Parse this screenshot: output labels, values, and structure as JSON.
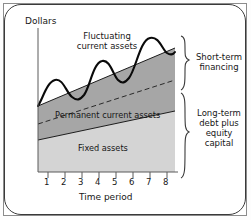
{
  "chart_data": {
    "type": "area",
    "title": "",
    "xlabel": "Time period",
    "ylabel": "Dollars",
    "xlim": [
      0,
      9
    ],
    "ylim": [
      0,
      100
    ],
    "grid": false,
    "legend_position": "inline-annotations",
    "xticks": [
      "1",
      "2",
      "3",
      "4",
      "5",
      "6",
      "7",
      "8"
    ],
    "yticks": [],
    "series": [
      {
        "name": "Fixed assets",
        "kind": "area",
        "color": "#d4d4d4",
        "x": [
          0,
          9
        ],
        "values": [
          18,
          40
        ],
        "note": "lower light-gray band, rises linearly left to right"
      },
      {
        "name": "Permanent current assets",
        "kind": "area",
        "color": "#a6a6a6",
        "x": [
          0,
          9
        ],
        "values": [
          30,
          62
        ],
        "note": "medium-gray band stacked above fixed assets, dashed midline inside"
      },
      {
        "name": "Fluctuating current assets",
        "kind": "line",
        "color": "#000000",
        "x": [
          0,
          0.6,
          1.3,
          2.0,
          2.7,
          3.3,
          4.0,
          4.7,
          5.3,
          6.0,
          6.7,
          7.4,
          8.1,
          8.7
        ],
        "values": [
          30,
          36,
          43,
          39,
          37,
          46,
          55,
          50,
          49,
          58,
          68,
          74,
          76,
          73
        ],
        "note": "wavy oscillating curve above the bands, four rising humps"
      }
    ],
    "annotations": [
      {
        "text": "Fluctuating current assets",
        "position": "upper-middle"
      },
      {
        "text": "Permanent current assets",
        "position": "inside-medium-gray-band"
      },
      {
        "text": "Fixed assets",
        "position": "inside-light-gray-band"
      },
      {
        "text": "Short-term financing",
        "position": "right-brace-upper"
      },
      {
        "text": "Long-term debt plus equity capital",
        "position": "right-brace-lower"
      }
    ]
  },
  "axes": {
    "y_label": "Dollars",
    "x_label": "Time period",
    "x_ticks": [
      "1",
      "2",
      "3",
      "4",
      "5",
      "6",
      "7",
      "8"
    ]
  },
  "annotations": {
    "fluctuating_line1": "Fluctuating",
    "fluctuating_line2": "current assets",
    "permanent": "Permanent current assets",
    "fixed": "Fixed assets"
  },
  "braces": {
    "short_term_line1": "Short-term",
    "short_term_line2": "financing",
    "long_term_line1": "Long-term",
    "long_term_line2": "debt plus",
    "long_term_line3": "equity",
    "long_term_line4": "capital"
  },
  "colors": {
    "fixed_assets_fill": "#d4d4d4",
    "permanent_assets_fill": "#a6a6a6",
    "curve": "#000000",
    "axis": "#555555"
  }
}
